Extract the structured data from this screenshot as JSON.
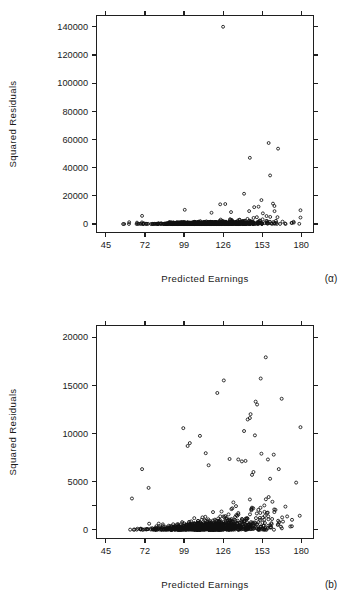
{
  "figure": {
    "panels": [
      {
        "id": "a",
        "panel_label": "(α)",
        "x_axis_title": "Predicted Earnings",
        "y_axis_title": "Squared Residuals"
      },
      {
        "id": "b",
        "panel_label": "(b)",
        "x_axis_title": "Predicted Earnings",
        "y_axis_title": "Squared Residuals"
      }
    ]
  },
  "chart_data": [
    {
      "type": "scatter",
      "id": "a",
      "title": "",
      "panel_label": "(α)",
      "xlabel": "Predicted Earnings",
      "ylabel": "Squared Residuals",
      "xlim": [
        38.5,
        188.5
      ],
      "ylim": [
        -6000,
        148000
      ],
      "xticks": [
        45,
        72,
        99,
        126,
        153,
        180
      ],
      "yticks": [
        0,
        20000,
        40000,
        60000,
        80000,
        100000,
        120000,
        140000
      ],
      "xtick_labels": [
        "45",
        "72",
        "99",
        "126",
        "153",
        "180"
      ],
      "ytick_labels": [
        "0",
        "20000",
        "40000",
        "60000",
        "80000",
        "100000",
        "120000",
        "140000"
      ],
      "grid": false,
      "legend": null,
      "marker": "open-circle",
      "n_points": 520,
      "notable_points": [
        [
          126.0,
          140000
        ],
        [
          157.5,
          57500
        ],
        [
          164.0,
          53500
        ],
        [
          144.5,
          47000
        ],
        [
          158.5,
          34500
        ],
        [
          140.5,
          21500
        ],
        [
          152.5,
          17000
        ],
        [
          160.5,
          14500
        ],
        [
          127.5,
          14200
        ],
        [
          124.0,
          14000
        ],
        [
          161.5,
          12800
        ],
        [
          150.5,
          12300
        ],
        [
          147.5,
          12000
        ],
        [
          99.5,
          10100
        ],
        [
          179.5,
          9800
        ],
        [
          144.0,
          9200
        ],
        [
          131.5,
          8500
        ],
        [
          118.0,
          8000
        ],
        [
          153.5,
          7600
        ],
        [
          70.0,
          5800
        ],
        [
          179.5,
          4600
        ]
      ],
      "bulk_description": "Dense band of points near zero spanning the full x range, widening slightly toward larger predicted earnings."
    },
    {
      "type": "scatter",
      "id": "b",
      "title": "",
      "panel_label": "(b)",
      "xlabel": "Predicted Earnings",
      "ylabel": "Squared Residuals",
      "xlim": [
        38.5,
        188.5
      ],
      "ylim": [
        -900,
        21200
      ],
      "xticks": [
        45,
        72,
        99,
        126,
        153,
        180
      ],
      "yticks": [
        0,
        5000,
        10000,
        15000,
        20000
      ],
      "xtick_labels": [
        "45",
        "72",
        "99",
        "126",
        "153",
        "180"
      ],
      "ytick_labels": [
        "0",
        "5000",
        "10000",
        "15000",
        "20000"
      ],
      "grid": false,
      "legend": null,
      "marker": "open-circle",
      "n_points": 600,
      "notable_points": [
        [
          155.5,
          17900
        ],
        [
          152.0,
          15700
        ],
        [
          126.5,
          15500
        ],
        [
          122.0,
          14200
        ],
        [
          166.5,
          13600
        ],
        [
          148.5,
          13300
        ],
        [
          149.5,
          13000
        ],
        [
          145.0,
          12000
        ],
        [
          144.5,
          11600
        ],
        [
          143.0,
          11450
        ],
        [
          179.5,
          10650
        ],
        [
          98.5,
          10550
        ],
        [
          140.5,
          10250
        ],
        [
          110.0,
          9750
        ],
        [
          148.0,
          9800
        ],
        [
          103.0,
          9000
        ],
        [
          101.5,
          8700
        ],
        [
          114.0,
          7950
        ],
        [
          152.5,
          7900
        ],
        [
          161.0,
          7800
        ],
        [
          130.5,
          7350
        ],
        [
          136.5,
          7300
        ],
        [
          157.0,
          7300
        ],
        [
          141.5,
          7150
        ],
        [
          139.0,
          7100
        ],
        [
          116.0,
          6700
        ],
        [
          164.5,
          6300
        ],
        [
          70.0,
          6300
        ],
        [
          147.0,
          6000
        ],
        [
          146.0,
          5700
        ],
        [
          158.5,
          5300
        ],
        [
          176.5,
          4900
        ],
        [
          74.5,
          4350
        ],
        [
          157.5,
          3400
        ],
        [
          63.0,
          3250
        ]
      ],
      "bulk_description": "Heteroscedastic cloud: dense low-residual mass from 90 to 160 with spread increasing toward higher predicted earnings."
    }
  ]
}
